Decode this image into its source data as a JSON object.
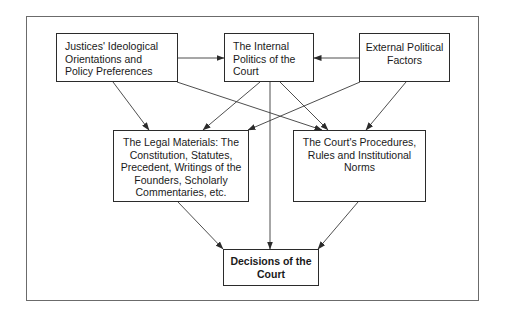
{
  "diagram": {
    "type": "flow",
    "nodes": {
      "ideology": "Justices' Ideological Orientations and Policy Preferences",
      "internal_politics": "The Internal Politics of the Court",
      "external_factors": "External Political Factors",
      "legal_materials": "The Legal Materials: The Constitution, Statutes, Precedent, Writings of the Founders, Scholarly Commentaries, etc.",
      "procedures": "The Court's Procedures, Rules and Institutional Norms",
      "decisions": "Decisions of the Court"
    },
    "edges": [
      {
        "from": "ideology",
        "to": "internal_politics"
      },
      {
        "from": "external_factors",
        "to": "internal_politics"
      },
      {
        "from": "ideology",
        "to": "legal_materials"
      },
      {
        "from": "ideology",
        "to": "procedures"
      },
      {
        "from": "internal_politics",
        "to": "legal_materials"
      },
      {
        "from": "internal_politics",
        "to": "procedures"
      },
      {
        "from": "internal_politics",
        "to": "decisions"
      },
      {
        "from": "external_factors",
        "to": "legal_materials"
      },
      {
        "from": "external_factors",
        "to": "procedures"
      },
      {
        "from": "legal_materials",
        "to": "decisions"
      },
      {
        "from": "procedures",
        "to": "decisions"
      }
    ]
  }
}
